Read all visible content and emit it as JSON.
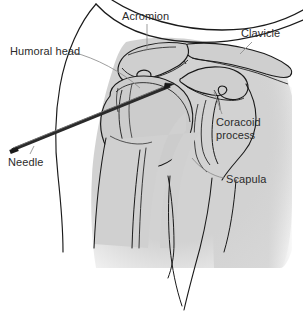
{
  "figure": {
    "name": "shoulder-joint-needle-injection-diagram",
    "width": 303,
    "height": 319,
    "background_color": "#ffffff",
    "bone_fill_color": "#c9c9c9",
    "soft_tissue_fill_color": "#d4d4d4",
    "outline_color": "#1a1a1a",
    "needle_color": "#2a2a2a",
    "label_color": "#2b2b2b",
    "leader_line_color": "#8a8a8a"
  },
  "labels": [
    {
      "id": "acromion",
      "text": "Acromion",
      "x": 122,
      "y": 11
    },
    {
      "id": "clavicle",
      "text": "Clavicle",
      "x": 241,
      "y": 28
    },
    {
      "id": "humoral-head",
      "text": "Humoral head",
      "x": 10,
      "y": 46
    },
    {
      "id": "coracoid-process",
      "text": "Coracoid\nprocess",
      "line1": "Coracoid",
      "line2": "process",
      "x": 216,
      "y": 117
    },
    {
      "id": "needle",
      "text": "Needle",
      "x": 8,
      "y": 157
    },
    {
      "id": "scapula",
      "text": "Scapula",
      "x": 226,
      "y": 174
    }
  ]
}
